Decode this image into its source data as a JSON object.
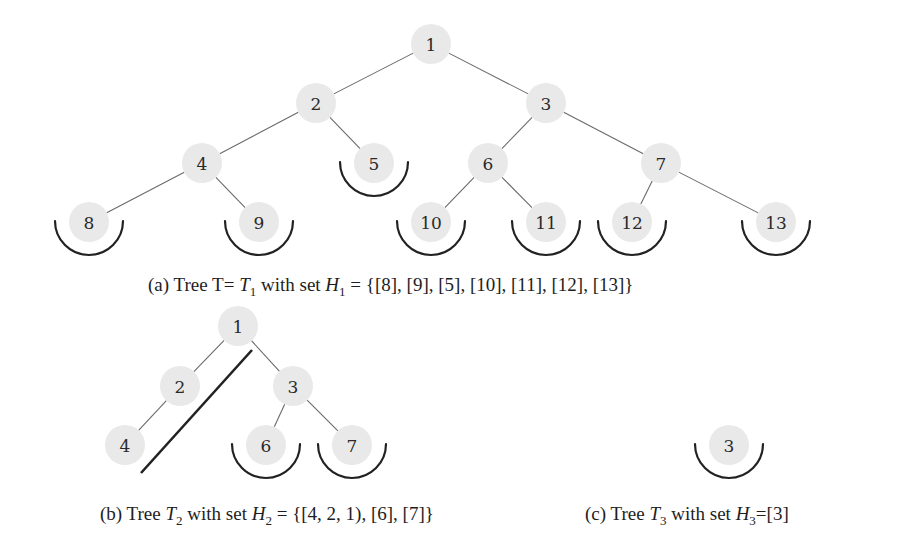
{
  "figure": {
    "subfigures": [
      {
        "id": "a",
        "caption": {
          "label": "(a)",
          "prefix": "Tree T= ",
          "tree_name": "T",
          "tree_sub": "1",
          "mid": " with set ",
          "set_name": "H",
          "set_sub": "1",
          "set_value": " = {[8], [9], [5], [10], [11], [12], [13]}"
        },
        "nodes": [
          {
            "id": "1",
            "x": 431,
            "y": 44
          },
          {
            "id": "2",
            "x": 316,
            "y": 103
          },
          {
            "id": "3",
            "x": 546,
            "y": 103
          },
          {
            "id": "4",
            "x": 202,
            "y": 163
          },
          {
            "id": "5",
            "x": 374,
            "y": 163,
            "arc": true
          },
          {
            "id": "6",
            "x": 488,
            "y": 163
          },
          {
            "id": "7",
            "x": 661,
            "y": 163
          },
          {
            "id": "8",
            "x": 89,
            "y": 222,
            "arc": true
          },
          {
            "id": "9",
            "x": 259,
            "y": 222,
            "arc": true
          },
          {
            "id": "10",
            "x": 431,
            "y": 222,
            "arc": true
          },
          {
            "id": "11",
            "x": 546,
            "y": 222,
            "arc": true
          },
          {
            "id": "12",
            "x": 632,
            "y": 222,
            "arc": true
          },
          {
            "id": "13",
            "x": 776,
            "y": 222,
            "arc": true
          }
        ],
        "edges": [
          [
            "1",
            "2"
          ],
          [
            "1",
            "3"
          ],
          [
            "2",
            "4"
          ],
          [
            "2",
            "5"
          ],
          [
            "3",
            "6"
          ],
          [
            "3",
            "7"
          ],
          [
            "4",
            "8"
          ],
          [
            "4",
            "9"
          ],
          [
            "6",
            "10"
          ],
          [
            "6",
            "11"
          ],
          [
            "7",
            "12"
          ],
          [
            "7",
            "13"
          ]
        ]
      },
      {
        "id": "b",
        "caption": {
          "label": "(b)",
          "prefix": "Tree ",
          "tree_name": "T",
          "tree_sub": "2",
          "mid": " with set ",
          "set_name": "H",
          "set_sub": "2",
          "set_value": " = {[4, 2, 1), [6], [7]}"
        },
        "nodes": [
          {
            "id": "1",
            "x": 238,
            "y": 326
          },
          {
            "id": "2",
            "x": 180,
            "y": 386
          },
          {
            "id": "3",
            "x": 293,
            "y": 386
          },
          {
            "id": "4",
            "x": 125,
            "y": 445
          },
          {
            "id": "6",
            "x": 266,
            "y": 445,
            "arc": true
          },
          {
            "id": "7",
            "x": 352,
            "y": 445,
            "arc": true
          }
        ],
        "edges": [
          [
            "1",
            "2"
          ],
          [
            "1",
            "3"
          ],
          [
            "2",
            "4"
          ],
          [
            "3",
            "6"
          ],
          [
            "3",
            "7"
          ]
        ],
        "cut_line": {
          "x1": 252,
          "y1": 350,
          "x2": 141,
          "y2": 473
        }
      },
      {
        "id": "c",
        "caption": {
          "label": "(c)",
          "prefix": "Tree ",
          "tree_name": "T",
          "tree_sub": "3",
          "mid": " with set ",
          "set_name": "H",
          "set_sub": "3",
          "set_value": "=[3]"
        },
        "nodes": [
          {
            "id": "3",
            "x": 729,
            "y": 445,
            "arc": true
          }
        ],
        "edges": []
      }
    ],
    "colors": {
      "node_fill": "#e9e9e9",
      "edge": "#6a6a6a",
      "arc": "#222222",
      "text": "#1e1e1e"
    }
  }
}
